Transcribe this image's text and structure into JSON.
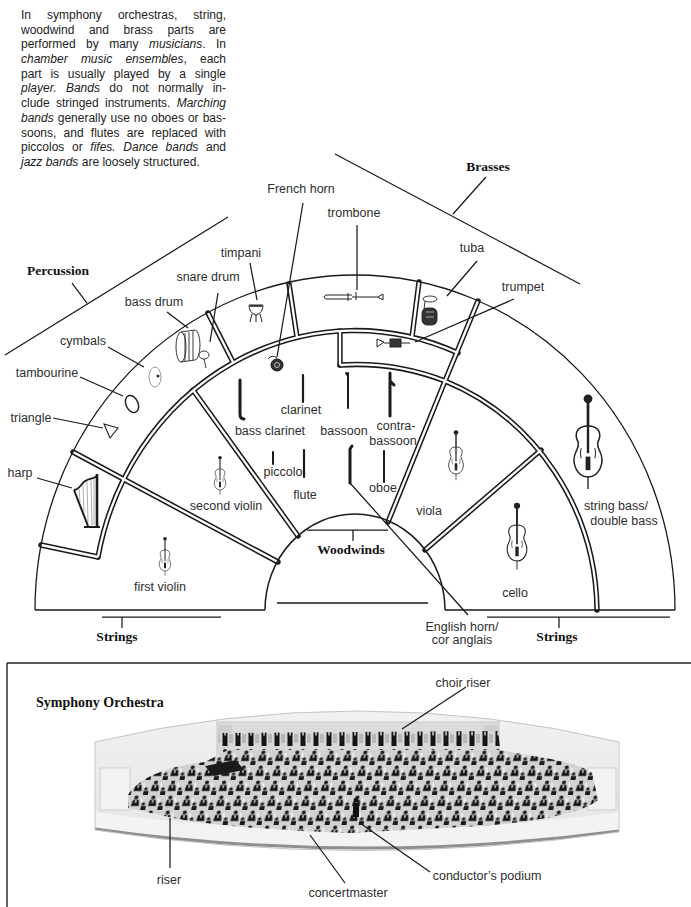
{
  "intro": {
    "lines": [
      {
        "segments": [
          {
            "text": "In symphony orchestras, string,",
            "italic": false
          }
        ]
      },
      {
        "segments": [
          {
            "text": "woodwind and brass parts are",
            "italic": false
          }
        ]
      },
      {
        "segments": [
          {
            "text": "performed by many ",
            "italic": false
          },
          {
            "text": "musicians",
            "italic": true
          },
          {
            "text": ". In",
            "italic": false
          }
        ]
      },
      {
        "segments": [
          {
            "text": "chamber music ensembles",
            "italic": true
          },
          {
            "text": ", each",
            "italic": false
          }
        ]
      },
      {
        "segments": [
          {
            "text": "part is usually played by a single",
            "italic": false
          }
        ]
      },
      {
        "segments": [
          {
            "text": "player. Bands",
            "italic": true
          },
          {
            "text": " do not normally in-",
            "italic": false
          }
        ]
      },
      {
        "segments": [
          {
            "text": "clude stringed instruments. ",
            "italic": false
          },
          {
            "text": "Marching",
            "italic": true
          }
        ]
      },
      {
        "segments": [
          {
            "text": "bands",
            "italic": true
          },
          {
            "text": " generally use no oboes or bas-",
            "italic": false
          }
        ]
      },
      {
        "segments": [
          {
            "text": "soons, and flutes are replaced with",
            "italic": false
          }
        ]
      },
      {
        "segments": [
          {
            "text": "piccolos or ",
            "italic": false
          },
          {
            "text": "fifes. Dance bands",
            "italic": true
          },
          {
            "text": " and",
            "italic": false
          }
        ]
      },
      {
        "segments": [
          {
            "text": "jazz bands",
            "italic": true
          },
          {
            "text": " are loosely structured.",
            "italic": false
          }
        ]
      }
    ]
  },
  "diagram": {
    "sections": {
      "percussion": "Percussion",
      "brasses": "Brasses",
      "woodwinds": "Woodwinds",
      "strings_left": "Strings",
      "strings_right": "Strings"
    },
    "instruments": {
      "french_horn": "French horn",
      "trombone": "trombone",
      "tuba": "tuba",
      "trumpet": "trumpet",
      "timpani": "timpani",
      "snare_drum": "snare drum",
      "bass_drum": "bass drum",
      "cymbals": "cymbals",
      "tambourine": "tambourine",
      "triangle": "triangle",
      "harp": "harp",
      "clarinet": "clarinet",
      "bass_clarinet": "bass clarinet",
      "bassoon": "bassoon",
      "contrabassoon": [
        "contra-",
        "bassoon"
      ],
      "piccolo": "piccolo",
      "flute": "flute",
      "oboe": "oboe",
      "second_violin": "second violin",
      "first_violin": "first violin",
      "viola": "viola",
      "cello": "cello",
      "string_bass": [
        "string bass/",
        "double bass"
      ],
      "english_horn": [
        "English horn/",
        "cor anglais"
      ]
    }
  },
  "photo_panel": {
    "title": "Symphony Orchestra",
    "labels": {
      "choir_riser": "choir riser",
      "riser": "riser",
      "concertmaster": "concertmaster",
      "conductors_podium": "conductor’s podium"
    }
  },
  "colors": {
    "ink": "#1a1a1a",
    "label_text": "#2e2e2e",
    "background": "#ffffff",
    "photo_background": "#e6e6e6"
  }
}
